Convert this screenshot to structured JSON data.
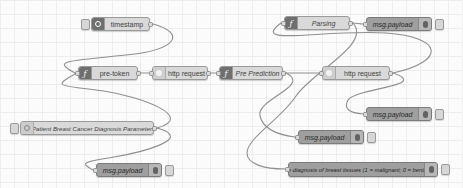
{
  "canvas": {
    "background": "#fbfbfb",
    "grid_color": "#ededed",
    "wire_color": "#8f8f8f",
    "node_fill": "#d9d9d9",
    "debug_node_fill": "#9f9f9f"
  },
  "nodes": [
    {
      "id": "timestamp",
      "type": "inject",
      "label": "timestamp",
      "icon": "clock-icon",
      "glyph": "ring",
      "x": 91,
      "y": 17,
      "w": 59,
      "h": 14,
      "button": "left",
      "ports": [
        "out"
      ]
    },
    {
      "id": "parsing",
      "type": "function",
      "label": "Parsing",
      "icon": "function-icon",
      "glyph": "f",
      "x": 284,
      "y": 16,
      "w": 66,
      "h": 14,
      "ports": [
        "in",
        "out"
      ]
    },
    {
      "id": "debug-1",
      "type": "debug",
      "label": "msg.payload",
      "icon": "bug-icon",
      "glyph": "bug",
      "x": 366,
      "y": 17,
      "w": 66,
      "h": 14,
      "button": "right",
      "ports": [
        "in"
      ]
    },
    {
      "id": "pre-token",
      "type": "function",
      "label": "pre-token",
      "icon": "function-icon",
      "glyph": "f",
      "x": 78,
      "y": 66,
      "w": 60,
      "h": 14,
      "ports": [
        "in",
        "out"
      ]
    },
    {
      "id": "http-request-1",
      "type": "http",
      "label": "http request",
      "icon": "globe-icon",
      "glyph": "disc",
      "x": 152,
      "y": 66,
      "w": 56,
      "h": 14,
      "ports": [
        "in",
        "out"
      ]
    },
    {
      "id": "pre-prediction",
      "type": "function",
      "label": "Pre Prediction",
      "icon": "function-icon",
      "glyph": "f",
      "x": 219,
      "y": 66,
      "w": 64,
      "h": 14,
      "ports": [
        "in",
        "out"
      ]
    },
    {
      "id": "http-request-2",
      "type": "http",
      "label": "http request",
      "icon": "globe-icon",
      "glyph": "disc",
      "x": 322,
      "y": 66,
      "w": 68,
      "h": 14,
      "ports": [
        "in",
        "out"
      ]
    },
    {
      "id": "patient-params",
      "type": "inject",
      "label": "Patient Breast Cancer Diagnosis Parameters",
      "icon": "inject-icon",
      "glyph": "ring-dark",
      "x": 20,
      "y": 121,
      "w": 134,
      "h": 14,
      "button": "left",
      "ports": [
        "out"
      ]
    },
    {
      "id": "debug-2",
      "type": "debug",
      "label": "msg.payload",
      "icon": "bug-icon",
      "glyph": "bug",
      "x": 366,
      "y": 107,
      "w": 66,
      "h": 14,
      "button": "right",
      "ports": [
        "in"
      ]
    },
    {
      "id": "debug-3",
      "type": "debug",
      "label": "msg.payload",
      "icon": "bug-icon",
      "glyph": "bug",
      "x": 298,
      "y": 130,
      "w": 66,
      "h": 14,
      "button": "right",
      "ports": [
        "in"
      ]
    },
    {
      "id": "debug-4",
      "type": "debug",
      "label": "msg.payload",
      "icon": "bug-icon",
      "glyph": "bug",
      "x": 96,
      "y": 163,
      "w": 66,
      "h": 14,
      "button": "right",
      "ports": [
        "in"
      ]
    },
    {
      "id": "diagnosis-debug",
      "type": "debug",
      "label": "The diagnosis of breast tissues (1 = malignant; 0 = benign)",
      "icon": "bug-icon",
      "glyph": "bug",
      "x": 288,
      "y": 162,
      "w": 150,
      "h": 15,
      "button": "right",
      "ports": [
        "in"
      ]
    }
  ],
  "wires": [
    {
      "from": "timestamp",
      "to": "pre-token",
      "path": "M153,24 C186,33 178,50 126,55 C70,61 50,60 75,73"
    },
    {
      "from": "patient-params",
      "to": "pre-token",
      "path": "M157,128 C196,117 142,97 104,91 C62,85 50,88 75,74"
    },
    {
      "from": "patient-params",
      "to": "debug-4",
      "path": "M157,128 C197,139 138,153 114,157 C86,162 78,162 93,170"
    },
    {
      "from": "pre-token",
      "to": "http-request-1",
      "path": "M141,73 L149,73"
    },
    {
      "from": "http-request-1",
      "to": "pre-prediction",
      "path": "M211,73 L216,73"
    },
    {
      "from": "pre-prediction",
      "to": "http-request-2",
      "path": "M286,73 C297,73 308,73 319,73"
    },
    {
      "from": "http-request-2",
      "to": "parsing",
      "path": "M393,73 C447,61 443,37 386,33 C323,29 249,47 281,23"
    },
    {
      "from": "parsing",
      "to": "debug-1",
      "path": "M353,23 C357,23 359,24 363,24"
    },
    {
      "from": "http-request-2",
      "to": "debug-2",
      "path": "M393,73 C431,86 356,88 348,100 C343,109 350,113 363,114"
    },
    {
      "from": "parsing",
      "to": "diagnosis-debug",
      "path": "M353,23 C372,44 312,72 296,96 C281,119 247,138 247,153 C247,164 264,169 285,169"
    },
    {
      "from": "pre-prediction",
      "to": "debug-3",
      "path": "M286,73 C312,86 256,99 260,116 C263,129 279,135 295,137"
    }
  ]
}
